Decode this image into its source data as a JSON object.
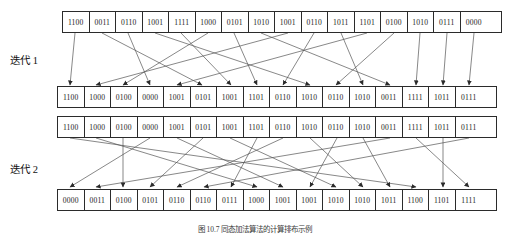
{
  "figure": {
    "caption": "图 10.7  同态加法算法的计算排布示例",
    "labels": {
      "iteration_1": "迭代 1",
      "iteration_2": "迭代 2"
    },
    "colors": {
      "stroke": "#2b2b2b",
      "line": "#555555",
      "text": "#1a1a1a",
      "background": "#ffffff"
    }
  },
  "chart_data": {
    "type": "diagram",
    "title": "图 10.7  同态加法算法的计算排布示例",
    "row_count": 4,
    "cells_per_row": 16,
    "rows": [
      {
        "name": "input-row",
        "stage": "input",
        "values": [
          "1100",
          "0011",
          "0110",
          "1001",
          "1111",
          "1000",
          "0101",
          "1010",
          "1001",
          "0110",
          "1011",
          "1101",
          "0100",
          "1010",
          "0111",
          "0000"
        ]
      },
      {
        "name": "iteration-1-output-row",
        "stage": "iteration-1-output",
        "values": [
          "1100",
          "1000",
          "0100",
          "0000",
          "1001",
          "0101",
          "1001",
          "1101",
          "0110",
          "1010",
          "0110",
          "1010",
          "0011",
          "1111",
          "1011",
          "0111"
        ]
      },
      {
        "name": "iteration-2-input-row",
        "stage": "iteration-2-input",
        "values": [
          "1100",
          "1000",
          "0100",
          "0000",
          "1001",
          "0101",
          "1001",
          "1101",
          "0110",
          "1010",
          "0110",
          "1010",
          "0011",
          "1111",
          "1011",
          "0111"
        ]
      },
      {
        "name": "iteration-2-output-row",
        "stage": "iteration-2-output",
        "values": [
          "0000",
          "0011",
          "0100",
          "0101",
          "0110",
          "0110",
          "0111",
          "1000",
          "1001",
          "1001",
          "1010",
          "1010",
          "1011",
          "1100",
          "1101",
          "1111"
        ]
      }
    ],
    "iteration_1_mapping": [
      0,
      5,
      12,
      15,
      6,
      2,
      9,
      14,
      3,
      1,
      13,
      10,
      7,
      4,
      11,
      8
    ],
    "iteration_2_mapping": [
      13,
      7,
      2,
      0,
      8,
      3,
      10,
      6,
      4,
      11,
      9,
      12,
      1,
      15,
      14,
      5
    ]
  }
}
